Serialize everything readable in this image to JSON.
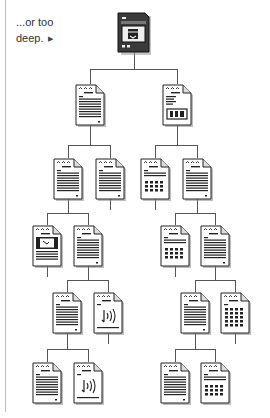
{
  "caption": {
    "text": "...or too",
    "text2": "deep.",
    "arrow": "▶"
  },
  "diagram": {
    "type": "hierarchy",
    "root": {
      "icon": "home-computer-icon"
    },
    "nodes": [
      {
        "id": "root",
        "icon": "computer-icon",
        "x": 118,
        "y": 12
      },
      {
        "id": "L1a",
        "icon": "text-document-icon",
        "x": 75,
        "y": 84
      },
      {
        "id": "L1b",
        "icon": "image-document-icon",
        "x": 162,
        "y": 84
      },
      {
        "id": "L2a",
        "icon": "text-document-icon",
        "x": 53,
        "y": 158
      },
      {
        "id": "L2b",
        "icon": "text-document-icon",
        "x": 95,
        "y": 158
      },
      {
        "id": "L2c",
        "icon": "table-document-icon",
        "x": 140,
        "y": 158
      },
      {
        "id": "L2d",
        "icon": "text-document-icon",
        "x": 182,
        "y": 158
      },
      {
        "id": "L3a",
        "icon": "video-document-icon",
        "x": 32,
        "y": 225
      },
      {
        "id": "L3b",
        "icon": "text-document-icon",
        "x": 73,
        "y": 225
      },
      {
        "id": "L3c",
        "icon": "table-document-icon",
        "x": 160,
        "y": 225
      },
      {
        "id": "L3d",
        "icon": "text-document-icon",
        "x": 200,
        "y": 225
      },
      {
        "id": "L4a",
        "icon": "text-document-icon",
        "x": 52,
        "y": 292
      },
      {
        "id": "L4b",
        "icon": "audio-document-icon",
        "x": 93,
        "y": 292
      },
      {
        "id": "L4c",
        "icon": "text-document-icon",
        "x": 180,
        "y": 292
      },
      {
        "id": "L4d",
        "icon": "grid-document-icon",
        "x": 220,
        "y": 292
      },
      {
        "id": "L5a",
        "icon": "text-document-icon",
        "x": 32,
        "y": 362
      },
      {
        "id": "L5b",
        "icon": "audio-document-icon",
        "x": 73,
        "y": 362
      },
      {
        "id": "L5c",
        "icon": "text-document-icon",
        "x": 160,
        "y": 362
      },
      {
        "id": "L5d",
        "icon": "table-document-icon",
        "x": 200,
        "y": 362
      }
    ]
  }
}
